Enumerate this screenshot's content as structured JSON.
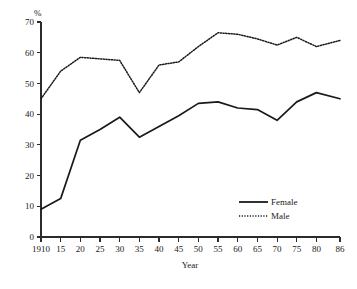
{
  "chart_data": {
    "type": "line",
    "title": "",
    "xlabel": "Year",
    "ylabel": "%",
    "unit_label": "%",
    "xlim": [
      1910,
      1986
    ],
    "ylim": [
      0,
      70
    ],
    "grid": false,
    "legend_position": "inside-bottom-right",
    "x": [
      1910,
      1915,
      1920,
      1925,
      1930,
      1935,
      1940,
      1945,
      1950,
      1955,
      1960,
      1965,
      1970,
      1975,
      1980,
      1986
    ],
    "x_tick_labels": [
      "1910",
      "15",
      "20",
      "25",
      "30",
      "35",
      "40",
      "45",
      "50",
      "55",
      "60",
      "65",
      "70",
      "75",
      "80",
      "86"
    ],
    "y_tick_labels": [
      "0",
      "10",
      "20",
      "30",
      "40",
      "50",
      "60",
      "70"
    ],
    "y_ticks": [
      0,
      10,
      20,
      30,
      40,
      50,
      60,
      70
    ],
    "series": [
      {
        "name": "Female",
        "style": "solid",
        "color": "#1a1a1a",
        "values": [
          9,
          12.5,
          31.5,
          35,
          39,
          32.5,
          36,
          39.5,
          43.5,
          44,
          42,
          41.5,
          38,
          44,
          47,
          45
        ]
      },
      {
        "name": "Male",
        "style": "dotted",
        "color": "#1a1a1a",
        "values": [
          45,
          54,
          58.5,
          58,
          57.5,
          47,
          56,
          57,
          62,
          66.5,
          66,
          64.5,
          62.5,
          65,
          62,
          64
        ]
      }
    ],
    "legend": [
      {
        "label": "Female",
        "style": "solid"
      },
      {
        "label": "Male",
        "style": "dotted"
      }
    ]
  }
}
